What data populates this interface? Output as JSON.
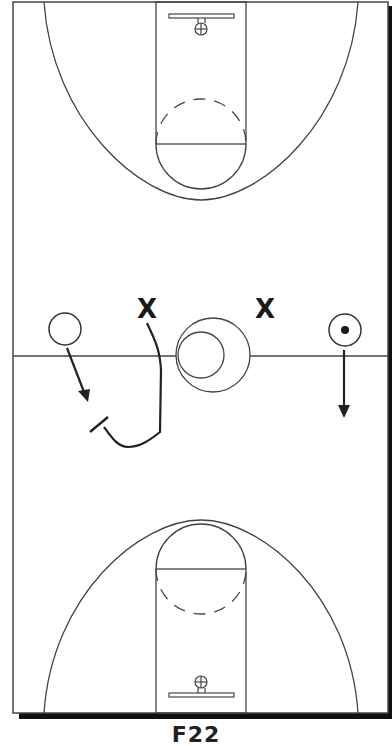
{
  "diagram": {
    "type": "basketball-full-court-play",
    "caption": "F22",
    "players": [
      {
        "symbol": "X",
        "role": "defender",
        "label": "X"
      },
      {
        "symbol": "X",
        "role": "defender",
        "label": "X"
      }
    ],
    "offense": [
      {
        "symbol": "circle",
        "role": "offensive-player-left"
      },
      {
        "symbol": "circle-dot",
        "role": "offensive-player-with-ball-right"
      }
    ],
    "actions": [
      {
        "type": "cut-arrow",
        "from": "left-offensive-player",
        "direction": "down-right"
      },
      {
        "type": "screen-path",
        "from": "left-defender",
        "description": "curl then screen"
      },
      {
        "type": "cut-arrow",
        "from": "right-offensive-player",
        "direction": "down"
      }
    ],
    "colors": {
      "line": "#333333",
      "ink": "#1a1a1a",
      "shadow": "#111111",
      "background": "#ffffff"
    }
  }
}
